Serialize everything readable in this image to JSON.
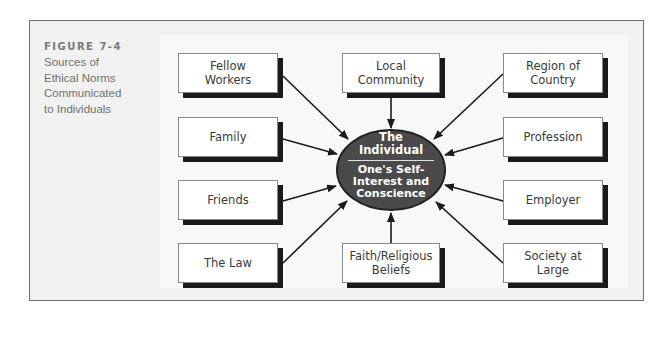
{
  "figure": {
    "label": "FIGURE 7-4",
    "caption_lines": [
      "Sources of",
      "Ethical Norms",
      "Communicated",
      "to Individuals"
    ]
  },
  "center": {
    "title_lines": [
      "The",
      "Individual"
    ],
    "subtitle_lines": [
      "One's Self-",
      "Interest and",
      "Conscience"
    ],
    "fill_color": "#4a4a4a"
  },
  "sources": {
    "left": [
      {
        "label": "Fellow\nWorkers"
      },
      {
        "label": "Family"
      },
      {
        "label": "Friends"
      },
      {
        "label": "The Law"
      }
    ],
    "top": {
      "label": "Local\nCommunity"
    },
    "bottom": {
      "label": "Faith/Religious\nBeliefs"
    },
    "right": [
      {
        "label": "Region of\nCountry"
      },
      {
        "label": "Profession"
      },
      {
        "label": "Employer"
      },
      {
        "label": "Society at\nLarge"
      }
    ]
  },
  "colors": {
    "frame_border": "#6e6e6e",
    "frame_bg": "#f1f1f1",
    "box_shadow": "#1a1a1a",
    "arrow": "#1a1a1a"
  }
}
